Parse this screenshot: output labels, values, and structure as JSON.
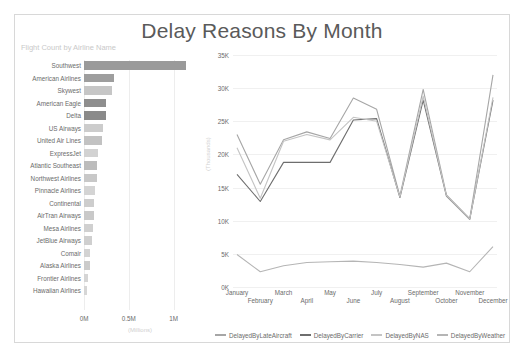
{
  "report": {
    "title": "Delay Reasons By Month"
  },
  "bar_chart": {
    "subtitle": "Flight Count by Airline Name",
    "axis_title": "(Millions)",
    "ticks": [
      "0M",
      "0.5M",
      "1M"
    ]
  },
  "line_chart": {
    "y_axis_title": "(Thousands)"
  },
  "legend": {
    "items": [
      {
        "label": "DelayedByLateAircraft",
        "color": "#a6a6a6"
      },
      {
        "label": "DelayedByCarrier",
        "color": "#6e6e6e"
      },
      {
        "label": "DelayedByNAS",
        "color": "#c4c4c4"
      },
      {
        "label": "DelayedByWeather",
        "color": "#b5b5b5"
      }
    ]
  },
  "chart_data": [
    {
      "type": "bar",
      "title": "Flight Count by Airline Name",
      "orientation": "horizontal",
      "xlabel": "(Millions)",
      "ylabel": "",
      "xlim": [
        0,
        1.25
      ],
      "xticks": [
        0,
        0.5,
        1
      ],
      "xtick_labels": [
        "0M",
        "0.5M",
        "1M"
      ],
      "grid": true,
      "categories": [
        "Southwest",
        "American Airlines",
        "Skywest",
        "American Eagle",
        "Delta",
        "US Airways",
        "United Air Lines",
        "ExpressJet",
        "Atlantic Southeast",
        "Northwest Airlines",
        "Pinnacle Airlines",
        "Continental",
        "AirTran Airways",
        "Mesa Airlines",
        "JetBlue Airways",
        "Comair",
        "Alaska Airlines",
        "Frontier Airlines",
        "Hawaiian Airlines"
      ],
      "values": [
        1.14,
        0.33,
        0.31,
        0.24,
        0.24,
        0.21,
        0.2,
        0.155,
        0.15,
        0.14,
        0.12,
        0.115,
        0.11,
        0.105,
        0.085,
        0.07,
        0.065,
        0.04,
        0.035
      ],
      "bar_colors": [
        "#9a9a9a",
        "#9e9e9e",
        "#c6c6c6",
        "#8e8e8e",
        "#8a8a8a",
        "#cccccc",
        "#c2c2c2",
        "#d2d2d2",
        "#bcbcbc",
        "#c8c8c8",
        "#d4d4d4",
        "#cdcdcd",
        "#c9c9c9",
        "#d0d0d0",
        "#cfcfcf",
        "#d3d3d3",
        "#cbcbcb",
        "#d5d5d5",
        "#d6d6d6"
      ]
    },
    {
      "type": "line",
      "title": "Delay Reasons By Month",
      "xlabel": "",
      "ylabel": "(Thousands)",
      "ylim": [
        0,
        35000
      ],
      "yticks": [
        0,
        5000,
        10000,
        15000,
        20000,
        25000,
        30000,
        35000
      ],
      "ytick_labels": [
        "0K",
        "5K",
        "10K",
        "15K",
        "20K",
        "25K",
        "30K",
        "35K"
      ],
      "grid": true,
      "legend_position": "bottom",
      "categories": [
        "January",
        "February",
        "March",
        "April",
        "May",
        "June",
        "July",
        "August",
        "September",
        "October",
        "November",
        "December"
      ],
      "series": [
        {
          "name": "DelayedByLateAircraft",
          "color": "#a6a6a6",
          "values": [
            23000,
            15500,
            22200,
            23400,
            22400,
            28500,
            26800,
            13700,
            29800,
            13900,
            10300,
            32000
          ]
        },
        {
          "name": "DelayedByCarrier",
          "color": "#6e6e6e",
          "values": [
            17000,
            12900,
            18800,
            18800,
            18800,
            25200,
            25400,
            13500,
            28200,
            13700,
            10200,
            28200
          ]
        },
        {
          "name": "DelayedByNAS",
          "color": "#c4c4c4",
          "values": [
            21000,
            13400,
            22000,
            23000,
            22200,
            25600,
            25000,
            13600,
            28800,
            13800,
            10250,
            28600
          ]
        },
        {
          "name": "DelayedByWeather",
          "color": "#b5b5b5",
          "values": [
            4900,
            2300,
            3200,
            3700,
            3800,
            3900,
            3700,
            3400,
            3000,
            3600,
            2300,
            6100
          ]
        }
      ]
    }
  ]
}
